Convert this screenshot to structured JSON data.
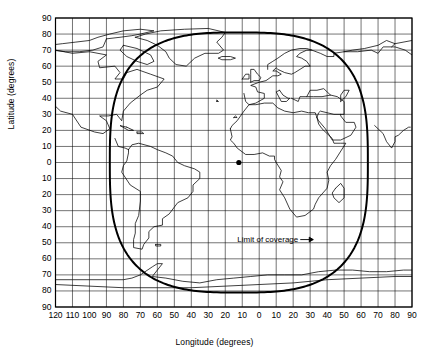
{
  "chart_data": {
    "type": "line",
    "title": "",
    "xlabel": "Longitude (degrees)",
    "ylabel": "Latitude (degrees)",
    "xlim": [
      -120,
      90
    ],
    "ylim": [
      -90,
      90
    ],
    "grid": true,
    "x_tick_labels": [
      "120",
      "110",
      "100",
      "90",
      "80",
      "70",
      "60",
      "50",
      "40",
      "30",
      "20",
      "10",
      "0",
      "10",
      "20",
      "30",
      "40",
      "50",
      "60",
      "70",
      "80",
      "90"
    ],
    "x_tick_values": [
      -120,
      -110,
      -100,
      -90,
      -80,
      -70,
      -60,
      -50,
      -40,
      -30,
      -20,
      -10,
      0,
      10,
      20,
      30,
      40,
      50,
      60,
      70,
      80,
      90
    ],
    "y_tick_labels": [
      "90",
      "80",
      "70",
      "60",
      "50",
      "40",
      "30",
      "20",
      "10",
      "0",
      "10",
      "20",
      "30",
      "40",
      "50",
      "60",
      "70",
      "80",
      "90"
    ],
    "y_tick_values": [
      90,
      80,
      70,
      60,
      50,
      40,
      30,
      20,
      10,
      0,
      -10,
      -20,
      -30,
      -40,
      -50,
      -60,
      -70,
      -80,
      -90
    ],
    "annotations": [
      {
        "text": "Limit of coverage",
        "lon": 23,
        "lat": -48
      }
    ],
    "series": [
      {
        "name": "Limit of coverage",
        "type": "closed-curve",
        "center_lon": -12,
        "center_lat": 0,
        "half_width_deg": 76,
        "half_height_deg": 81
      },
      {
        "name": "Sub-satellite point",
        "type": "point",
        "lon": -12,
        "lat": 0
      }
    ]
  }
}
